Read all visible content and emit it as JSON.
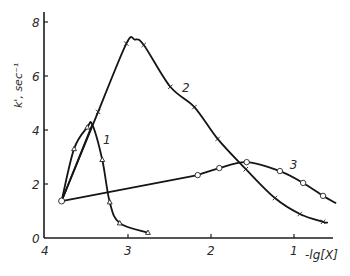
{
  "chart_data": {
    "type": "line",
    "title": "",
    "xlabel": "-lg[X]",
    "ylabel": "k', sec⁻¹",
    "x_reversed": true,
    "xlim": [
      4.0,
      0.55
    ],
    "ylim": [
      0,
      8.3
    ],
    "grid": false,
    "legend": "inline curve labels",
    "x_ticks": [
      4,
      3,
      2,
      1
    ],
    "y_ticks": [
      0,
      2,
      4,
      6,
      8
    ],
    "x_tick_labels": [
      "4",
      "3",
      "2",
      "1"
    ],
    "y_tick_labels": [
      "0",
      "2",
      "4",
      "6",
      "8"
    ],
    "series": [
      {
        "name": "1",
        "marker": "triangle",
        "label_pos": [
          3.3,
          3.5
        ],
        "x": [
          3.8,
          3.65,
          3.49,
          3.43,
          3.31,
          3.22,
          3.1,
          2.76
        ],
        "y": [
          1.37,
          3.3,
          4.1,
          4.2,
          2.9,
          1.33,
          0.55,
          0.2
        ],
        "markers_x": [
          3.65,
          3.49,
          3.31,
          3.22,
          3.1,
          2.76
        ],
        "markers_y": [
          3.3,
          4.1,
          2.9,
          1.33,
          0.55,
          0.2
        ]
      },
      {
        "name": "2",
        "marker": "x",
        "label_pos": [
          2.35,
          5.4
        ],
        "x": [
          3.8,
          3.36,
          3.02,
          2.92,
          2.81,
          2.49,
          2.2,
          1.92,
          1.58,
          1.23,
          0.93,
          0.65,
          0.6
        ],
        "y": [
          1.37,
          4.67,
          7.2,
          7.35,
          7.15,
          5.6,
          4.85,
          3.67,
          2.55,
          1.48,
          0.89,
          0.6,
          0.57
        ],
        "markers_x": [
          3.36,
          3.02,
          2.81,
          2.49,
          2.2,
          1.92,
          1.58,
          1.23,
          0.93,
          0.65
        ],
        "markers_y": [
          4.67,
          7.2,
          7.15,
          5.6,
          4.85,
          3.67,
          2.55,
          1.48,
          0.89,
          0.6
        ]
      },
      {
        "name": "3",
        "marker": "circle",
        "label_pos": [
          1.05,
          2.55
        ],
        "x": [
          3.8,
          2.16,
          1.9,
          1.57,
          1.17,
          0.89,
          0.65,
          0.5
        ],
        "y": [
          1.37,
          2.33,
          2.59,
          2.81,
          2.48,
          2.04,
          1.56,
          1.3
        ],
        "markers_x": [
          3.8,
          2.16,
          1.9,
          1.57,
          1.17,
          0.89,
          0.65
        ],
        "markers_y": [
          1.37,
          2.33,
          2.59,
          2.81,
          2.48,
          2.04,
          1.56
        ]
      }
    ],
    "annotations": [
      {
        "text": "shared origin point",
        "x": 3.8,
        "y": 1.37
      }
    ]
  },
  "layout": {
    "plot": {
      "x0_px": 45,
      "px_per_x": 83,
      "y0_px": 238,
      "px_per_y": 27,
      "x_axis_end_px": 333,
      "y_axis_top_px": 12
    }
  }
}
